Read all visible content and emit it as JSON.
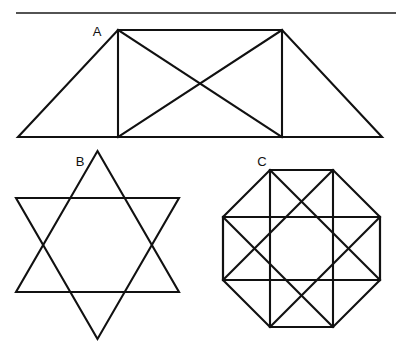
{
  "page": {
    "background_color": "#ffffff",
    "ink_color": "#111111",
    "width": 396,
    "height": 353
  },
  "divider": {
    "name": "top-horizontal-rule",
    "x1": 16,
    "y1": 13,
    "x2": 396,
    "y2": 13,
    "color": "#1a1a1a"
  },
  "labels": {
    "a": "A",
    "b": "B",
    "c": "C"
  },
  "figures": [
    {
      "id": "A",
      "label": "A",
      "name": "trapezoid-with-rectangle-and-diagonals",
      "description": "Isosceles trapezoid containing an inscribed rectangle and both rectangle diagonals",
      "label_position": {
        "x": 97,
        "y": 36
      },
      "outline_points": "18,137 118,30 282,30 382,137",
      "inner_segments": [
        "118,30 118,137",
        "282,30 282,137",
        "118,30 282,137",
        "282,30 118,137"
      ],
      "line_count": 8
    },
    {
      "id": "B",
      "label": "B",
      "name": "hexagram-star-of-david",
      "description": "Six-pointed star formed by two overlapping equilateral triangles",
      "label_position": {
        "x": 80,
        "y": 166
      },
      "center": {
        "x": 97.5,
        "y": 245
      },
      "radius": 94,
      "triangle_up_points": "97.5,151 179,292 16,292",
      "triangle_down_points": "97.5,339 16,198 179,198",
      "line_count": 6
    },
    {
      "id": "C",
      "label": "C",
      "name": "octagon-with-inscribed-squares",
      "description": "Regular octagon containing an axis-aligned square, a rotated square and connecting diagonals",
      "label_position": {
        "x": 262,
        "y": 166
      },
      "center": {
        "x": 301.5,
        "y": 248.5
      },
      "octagon_points": "270,170 333,170 380,217 380,280 333,327 270,327 223,280 223,217",
      "square_axis_points": "270,170 333,170 333,327 270,327",
      "square_side_points": "223,217 380,217 380,280 223,280",
      "diagonal_segments": [
        "270,170 380,280",
        "333,170 223,280",
        "223,217 333,327",
        "380,217 270,327"
      ],
      "line_count": 16
    }
  ]
}
